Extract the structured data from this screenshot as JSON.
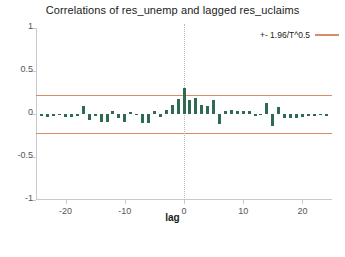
{
  "chart_data": {
    "type": "bar",
    "title": "Correlations of res_unemp and lagged res_uclaims",
    "xlabel": "lag",
    "ylabel": "",
    "xlim": [
      -25,
      25
    ],
    "ylim": [
      -1,
      1
    ],
    "grid": false,
    "legend_position": "top-right",
    "legend": [
      {
        "label": "+- 1.96/T^0.5",
        "color": "#d98b6a",
        "style": "line"
      }
    ],
    "annotations": [
      {
        "name": "zero-lag-reference-line",
        "x": 0,
        "style": "dotted-vertical",
        "color": "#b9b9b9"
      },
      {
        "name": "upper-confidence-band",
        "y": 0.22,
        "style": "horizontal-line",
        "color": "#d98b6a"
      },
      {
        "name": "lower-confidence-band",
        "y": -0.22,
        "style": "horizontal-line",
        "color": "#d98b6a"
      }
    ],
    "bar_color": "#2f6b50",
    "xticks": [
      -20,
      -10,
      0,
      10,
      20
    ],
    "xtick_labels": [
      "-20",
      "-10",
      "0",
      "10",
      "20"
    ],
    "yticks": [
      -1,
      -0.5,
      0,
      0.5,
      1
    ],
    "ytick_labels": [
      "-1",
      "-0.5",
      "0",
      "0.5",
      "1"
    ],
    "categories": [
      -24,
      -23,
      -22,
      -21,
      -20,
      -19,
      -18,
      -17,
      -16,
      -15,
      -14,
      -13,
      -12,
      -11,
      -10,
      -9,
      -8,
      -7,
      -6,
      -5,
      -4,
      -3,
      -2,
      -1,
      0,
      1,
      2,
      3,
      4,
      5,
      6,
      7,
      8,
      9,
      10,
      11,
      12,
      13,
      14,
      15,
      16,
      17,
      18,
      19,
      20,
      21,
      22,
      23,
      24
    ],
    "values": [
      -0.02,
      -0.03,
      -0.02,
      -0.01,
      -0.04,
      -0.03,
      -0.02,
      0.09,
      -0.07,
      -0.02,
      -0.09,
      -0.09,
      0.03,
      -0.05,
      -0.09,
      0.02,
      -0.01,
      -0.1,
      -0.11,
      0.04,
      -0.04,
      0.05,
      0.1,
      0.17,
      0.3,
      0.16,
      0.19,
      0.1,
      0.09,
      0.16,
      -0.12,
      0.03,
      0.05,
      0.03,
      0.04,
      0.03,
      -0.02,
      -0.01,
      0.13,
      -0.14,
      0.08,
      -0.05,
      -0.05,
      -0.05,
      -0.04,
      -0.02,
      -0.02,
      -0.01,
      -0.02
    ]
  }
}
